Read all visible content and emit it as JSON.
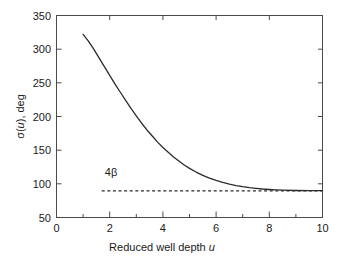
{
  "chart_data": {
    "type": "line",
    "title": "",
    "xlabel": "Reduced well depth u",
    "xlabel_plain": "Reduced well depth",
    "xlabel_italic": "u",
    "ylabel": "σ(u), deg",
    "ylabel_parts": {
      "sigma": "σ(",
      "var": "u",
      "rest": "), deg"
    },
    "xlim": [
      0,
      10
    ],
    "ylim": [
      50,
      350
    ],
    "xticks": [
      0,
      2,
      4,
      6,
      8,
      10
    ],
    "xticklabels": [
      "0",
      "2",
      "4",
      "6",
      "8",
      "10"
    ],
    "xminorticks": [
      1,
      3,
      5,
      7,
      9
    ],
    "yticks": [
      50,
      100,
      150,
      200,
      250,
      300,
      350
    ],
    "yticklabels": [
      "50",
      "100",
      "150",
      "200",
      "250",
      "300",
      "350"
    ],
    "grid": false,
    "legend": "none",
    "series": [
      {
        "name": "sigma(u)",
        "style": "solid",
        "color": "#2b2b2b",
        "x": [
          1.0,
          1.2,
          1.4,
          1.6,
          1.8,
          2.0,
          2.2,
          2.4,
          2.6,
          2.8,
          3.0,
          3.2,
          3.4,
          3.6,
          3.8,
          4.0,
          4.2,
          4.4,
          4.6,
          4.8,
          5.0,
          5.25,
          5.5,
          5.75,
          6.0,
          6.25,
          6.5,
          6.75,
          7.0,
          7.25,
          7.5,
          7.75,
          8.0,
          8.25,
          8.5,
          9.0,
          9.5,
          10.0
        ],
        "y": [
          322.0,
          312.0,
          300.0,
          287.0,
          274.0,
          261.0,
          248.0,
          236.0,
          224.0,
          212.0,
          201.0,
          190.0,
          180.0,
          171.0,
          162.0,
          154.0,
          147.0,
          140.0,
          134.0,
          128.0,
          123.0,
          117.5,
          112.5,
          108.5,
          105.0,
          102.0,
          99.5,
          97.5,
          95.8,
          94.4,
          93.3,
          92.3,
          91.6,
          91.0,
          90.6,
          90.1,
          89.9,
          89.8
        ]
      },
      {
        "name": "4 beta asymptote",
        "style": "dashed",
        "color": "#2b2b2b",
        "x": [
          1.7,
          10.0
        ],
        "y": [
          89.6,
          89.6
        ],
        "value": 89.6
      }
    ],
    "annotations": [
      {
        "name": "four-beta-label",
        "text": "4β",
        "text_number": "4",
        "text_symbol": "β",
        "x": 2.05,
        "y": 112
      }
    ]
  },
  "colors": {
    "background": "#ffffff",
    "axis": "#4a4a4a",
    "curve": "#2b2b2b",
    "text": "#1a1a1a"
  }
}
